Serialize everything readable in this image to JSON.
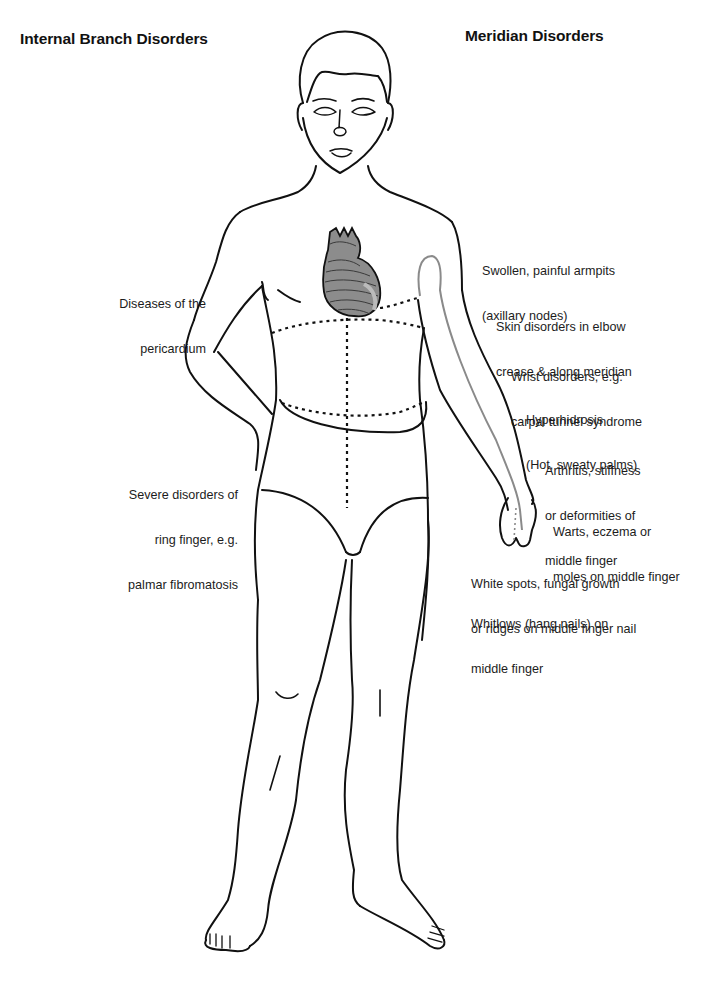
{
  "headings": {
    "left": "Internal Branch Disorders",
    "right": "Meridian Disorders"
  },
  "figure": {
    "highlight_color": "#8a8a8a",
    "line_color": "#111111"
  },
  "internal_branch_disorders": [
    {
      "id": "pericardium",
      "lines": [
        "Diseases of the",
        "pericardium"
      ]
    },
    {
      "id": "ring-finger",
      "lines": [
        "Severe disorders of",
        "ring finger, e.g.",
        "palmar fibromatosis"
      ]
    }
  ],
  "meridian_disorders": [
    {
      "id": "armpits",
      "lines": [
        "Swollen, painful armpits",
        "(axillary nodes)"
      ]
    },
    {
      "id": "elbow",
      "lines": [
        "Skin disorders in elbow",
        "crease & along meridian"
      ]
    },
    {
      "id": "wrist",
      "lines": [
        "Wrist disorders, e.g.",
        "carpal tunnel syndrome"
      ]
    },
    {
      "id": "hyperhidrosis",
      "lines": [
        "Hyperhidrosis",
        "(Hot, sweaty palms)"
      ]
    },
    {
      "id": "arthritis",
      "lines": [
        "Arthritis, stiffness",
        "or deformities of",
        "middle finger"
      ]
    },
    {
      "id": "warts",
      "lines": [
        "Warts, eczema or",
        "moles on middle finger"
      ]
    },
    {
      "id": "white-spots",
      "lines": [
        "White spots, fungal growth",
        "or ridges on middle finger nail"
      ]
    },
    {
      "id": "whitlows",
      "lines": [
        "Whitlows (hang nails) on",
        "middle finger"
      ]
    }
  ]
}
